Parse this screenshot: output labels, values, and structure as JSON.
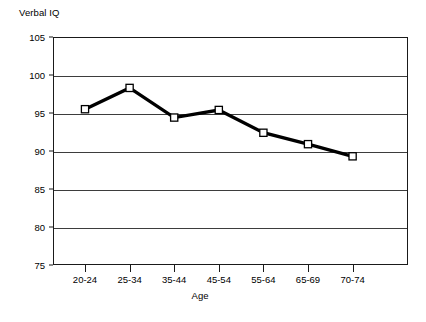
{
  "chart_data": {
    "type": "line",
    "title": "",
    "ylabel": "Verbal IQ",
    "xlabel": "Age",
    "categories": [
      "20-24",
      "25-34",
      "35-44",
      "45-54",
      "55-64",
      "65-69",
      "70-74"
    ],
    "values": [
      95.5,
      98.3,
      94.4,
      95.4,
      92.4,
      90.9,
      89.3
    ],
    "ylim": [
      75,
      105
    ],
    "yticks": [
      75,
      80,
      85,
      90,
      95,
      100,
      105
    ],
    "ytick_labels": [
      "75",
      "80",
      "85",
      "90",
      "95",
      "100",
      "105"
    ],
    "grid": true,
    "legend": false,
    "series": [
      {
        "name": "Verbal IQ",
        "values": [
          95.5,
          98.3,
          94.4,
          95.4,
          92.4,
          90.9,
          89.3
        ],
        "line_color": "#000000",
        "marker": "square",
        "marker_fill": "#ffffff",
        "marker_edge": "#000000"
      }
    ]
  },
  "axes": {
    "y_title": "Verbal IQ",
    "x_title": "Age"
  },
  "colors": {
    "line": "#000000",
    "marker_fill": "#ffffff",
    "frame": "#1a1a1a",
    "gridline": "#3d3d3d",
    "background": "#ffffff"
  }
}
